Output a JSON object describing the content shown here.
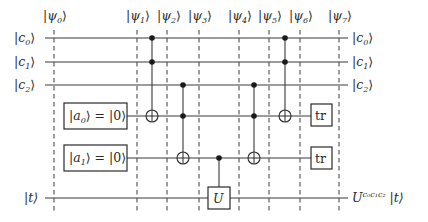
{
  "diagram": {
    "type": "quantum-circuit",
    "colors": {
      "stroke": "#3a3a3a",
      "text": "#2a2a2a",
      "background": "#ffffff"
    },
    "states": [
      {
        "id": "psi0",
        "label_main": "|ψ",
        "sub": "0",
        "close": "⟩",
        "x": 54
      },
      {
        "id": "psi1",
        "label_main": "|ψ",
        "sub": "1",
        "close": "⟩",
        "x": 137
      },
      {
        "id": "psi2",
        "label_main": "|ψ",
        "sub": "2",
        "close": "⟩",
        "x": 167
      },
      {
        "id": "psi3",
        "label_main": "|ψ",
        "sub": "3",
        "close": "⟩",
        "x": 199
      },
      {
        "id": "psi4",
        "label_main": "|ψ",
        "sub": "4",
        "close": "⟩",
        "x": 239
      },
      {
        "id": "psi5",
        "label_main": "|ψ",
        "sub": "5",
        "close": "⟩",
        "x": 269
      },
      {
        "id": "psi6",
        "label_main": "|ψ",
        "sub": "6",
        "close": "⟩",
        "x": 300
      },
      {
        "id": "psi7",
        "label_main": "|ψ",
        "sub": "7",
        "close": "⟩",
        "x": 339
      }
    ],
    "wires": [
      {
        "id": "c0",
        "in_main": "|c",
        "in_sub": "0",
        "in_close": "⟩",
        "out_main": "|c",
        "out_sub": "0",
        "out_close": "⟩",
        "y": 38
      },
      {
        "id": "c1",
        "in_main": "|c",
        "in_sub": "1",
        "in_close": "⟩",
        "out_main": "|c",
        "out_sub": "1",
        "out_close": "⟩",
        "y": 62
      },
      {
        "id": "c2",
        "in_main": "|c",
        "in_sub": "2",
        "in_close": "⟩",
        "out_main": "|c",
        "out_sub": "2",
        "out_close": "⟩",
        "y": 85
      },
      {
        "id": "a0",
        "init_main": "|a",
        "init_sub": "0",
        "init_rest": "⟩ = |0⟩",
        "trace": "tr",
        "y": 116
      },
      {
        "id": "a1",
        "init_main": "|a",
        "init_sub": "1",
        "init_rest": "⟩ = |0⟩",
        "trace": "tr",
        "y": 158
      },
      {
        "id": "t",
        "in_label": "|t⟩",
        "out_main": "U",
        "out_sup": "c₀c₁c₂",
        "out_rest": " |t⟩",
        "y": 198
      }
    ],
    "gates": [
      {
        "type": "toffoli",
        "x": 152,
        "controls": [
          "c0",
          "c1"
        ],
        "target": "a0"
      },
      {
        "type": "toffoli",
        "x": 183,
        "controls": [
          "c2",
          "a0"
        ],
        "target": "a1"
      },
      {
        "type": "controlled-U",
        "x": 219,
        "controls": [
          "a1"
        ],
        "target": "t",
        "label": "U"
      },
      {
        "type": "toffoli",
        "x": 254,
        "controls": [
          "c2",
          "a0"
        ],
        "target": "a1"
      },
      {
        "type": "toffoli",
        "x": 285,
        "controls": [
          "c0",
          "c1"
        ],
        "target": "a0"
      }
    ]
  }
}
